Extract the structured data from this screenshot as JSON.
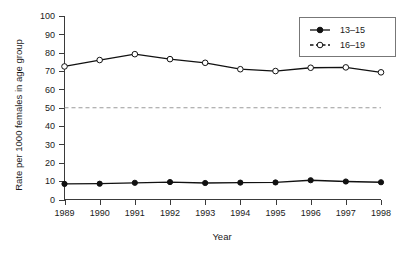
{
  "chart_data": {
    "type": "line",
    "title": "",
    "xlabel": "Year",
    "ylabel": "Rate per 1000 females in age group",
    "x": [
      1989,
      1990,
      1991,
      1992,
      1993,
      1994,
      1995,
      1996,
      1997,
      1998
    ],
    "xtick_labels": [
      "1989",
      "1990",
      "1991",
      "1992",
      "1993",
      "1994",
      "1995",
      "1996",
      "1997",
      "1998"
    ],
    "ytick_labels": [
      "0",
      "10",
      "20",
      "30",
      "40",
      "50",
      "60",
      "70",
      "80",
      "90",
      "100"
    ],
    "yticks": [
      0,
      10,
      20,
      30,
      40,
      50,
      60,
      70,
      80,
      90,
      100
    ],
    "ylim": [
      0,
      100
    ],
    "xlim": [
      1989,
      1998
    ],
    "grid": false,
    "legend_position": "top-right",
    "series": [
      {
        "name": "13–15",
        "marker": "filled-circle",
        "linestyle": "solid",
        "color": "#111111",
        "values": [
          8.5,
          8.6,
          9.1,
          9.5,
          9.0,
          9.2,
          9.3,
          10.5,
          9.8,
          9.4
        ]
      },
      {
        "name": "16–19",
        "marker": "open-circle",
        "linestyle": "solid",
        "color": "#111111",
        "values": [
          72.5,
          76.0,
          79.2,
          76.5,
          74.5,
          71.0,
          70.0,
          71.8,
          72.0,
          69.3
        ]
      }
    ],
    "annotations": [
      {
        "type": "hline",
        "name": "reference-line-50",
        "value": 50,
        "linestyle": "dashed",
        "color": "#9a9a9a"
      }
    ]
  },
  "legend": {
    "entries": [
      {
        "label": "13–15",
        "marker": "filled-circle",
        "linestyle": "solid"
      },
      {
        "label": "16–19",
        "marker": "open-circle",
        "linestyle": "dashed"
      }
    ]
  },
  "axes": {
    "y_title": "Rate per 1000 females in age group",
    "x_title": "Year"
  }
}
